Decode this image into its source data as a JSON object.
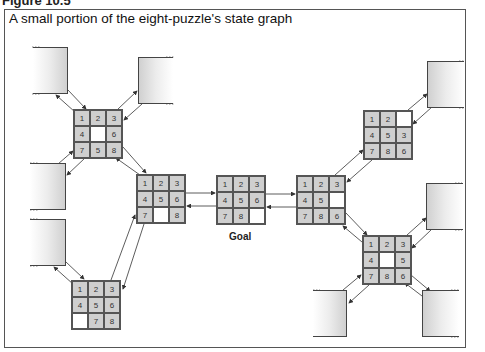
{
  "figure": {
    "label": "Figure 10.5",
    "title": "A small portion of the eight-puzzle's state graph",
    "goal_label": "Goal"
  },
  "puzzles": {
    "top_left": {
      "cells": [
        "1",
        "2",
        "3",
        "4",
        "",
        "6",
        "7",
        "5",
        "8"
      ]
    },
    "mid_left": {
      "cells": [
        "1",
        "2",
        "3",
        "4",
        "5",
        "6",
        "7",
        "",
        "8"
      ]
    },
    "bottom_left": {
      "cells": [
        "1",
        "2",
        "3",
        "4",
        "5",
        "6",
        "",
        "7",
        "8"
      ]
    },
    "goal": {
      "cells": [
        "1",
        "2",
        "3",
        "4",
        "5",
        "6",
        "7",
        "8",
        ""
      ]
    },
    "right": {
      "cells": [
        "1",
        "2",
        "3",
        "4",
        "5",
        "",
        "7",
        "8",
        "6"
      ]
    },
    "upper_right": {
      "cells": [
        "1",
        "2",
        "",
        "4",
        "5",
        "3",
        "7",
        "8",
        "6"
      ]
    },
    "lower_right": {
      "cells": [
        "1",
        "2",
        "3",
        "4",
        "",
        "5",
        "7",
        "8",
        "6"
      ]
    }
  },
  "colors": {
    "tile": "#cfcfcf",
    "blank": "#ffffff",
    "border": "#555555"
  }
}
